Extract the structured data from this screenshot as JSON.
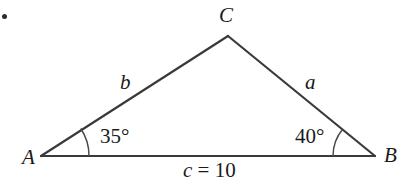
{
  "figure": {
    "type": "triangle-diagram",
    "background_color": "#ffffff",
    "stroke_color": "#3a3a3a",
    "text_color": "#1a1a1a"
  },
  "vertices": [
    {
      "name": "A",
      "label": "A",
      "x": 41,
      "y": 156,
      "label_x": 22,
      "label_y": 155
    },
    {
      "name": "B",
      "label": "B",
      "x": 375,
      "y": 156,
      "label_x": 384,
      "label_y": 153
    },
    {
      "name": "C",
      "label": "C",
      "x": 228,
      "y": 36,
      "label_x": 219,
      "label_y": 7
    }
  ],
  "sides": [
    {
      "name": "b",
      "label": "b",
      "from": "A",
      "to": "C",
      "label_x": 120,
      "label_y": 74
    },
    {
      "name": "a",
      "label": "a",
      "from": "C",
      "to": "B",
      "label_x": 305,
      "label_y": 74
    },
    {
      "name": "c",
      "label": "c = 10",
      "value": 10,
      "from": "A",
      "to": "B",
      "label_x": 183,
      "label_y": 162
    }
  ],
  "angles": [
    {
      "at": "A",
      "label": "35°",
      "value": 35,
      "label_x": 100,
      "label_y": 127,
      "arc_radius": 48
    },
    {
      "at": "B",
      "label": "40°",
      "value": 40,
      "label_x": 295,
      "label_y": 127,
      "arc_radius": 42
    }
  ],
  "marks": {
    "corner_bullet": "•"
  }
}
